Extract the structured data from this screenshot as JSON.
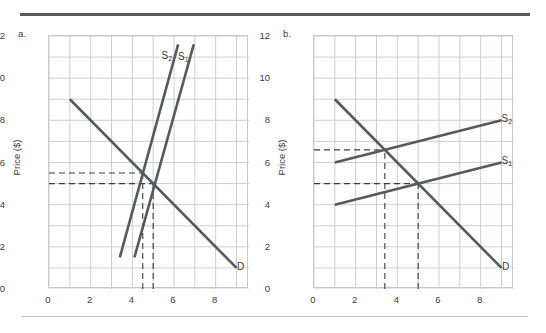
{
  "figure": {
    "background": "#ffffff",
    "rule_color": "#555a5e",
    "curve_color": "#555a5e",
    "grid_color": "#ccd0d2",
    "dash_color": "#3a3d40"
  },
  "chart_data": [
    {
      "type": "line",
      "panel": "a",
      "panel_label": "a.",
      "title": "",
      "xlabel": "",
      "ylabel": "Price ($)",
      "xlim": [
        0,
        9.6
      ],
      "ylim": [
        0,
        12
      ],
      "xticks": [
        0,
        2,
        4,
        6,
        8
      ],
      "yticks": [
        0,
        2,
        4,
        6,
        8,
        10,
        12
      ],
      "grid": true,
      "grid_step_x": 1,
      "grid_step_y": 1,
      "legend": "inline-labels",
      "series": [
        {
          "name": "D",
          "label": "D",
          "points": [
            [
              1,
              9
            ],
            [
              9,
              1
            ]
          ],
          "label_at": [
            9.25,
            1.05
          ]
        },
        {
          "name": "S1",
          "label": "S₁",
          "points": [
            [
              4.1,
              1.5
            ],
            [
              6.95,
              11.6
            ]
          ],
          "label_at": [
            6.5,
            11.0
          ]
        },
        {
          "name": "S2",
          "label": "S₂",
          "points": [
            [
              3.4,
              1.5
            ],
            [
              6.2,
              11.6
            ]
          ],
          "label_at": [
            5.7,
            11.05
          ]
        }
      ],
      "annotations": [
        {
          "type": "hline-dashed",
          "y": 5.5,
          "x_from": 0,
          "x_to": 4.5
        },
        {
          "type": "hline-dashed",
          "y": 5.0,
          "x_from": 0,
          "x_to": 5.0
        },
        {
          "type": "vline-dashed",
          "x": 4.5,
          "y_from": 0,
          "y_to": 5.5
        },
        {
          "type": "vline-dashed",
          "x": 5.0,
          "y_from": 0,
          "y_to": 5.0
        }
      ],
      "equilibria": [
        {
          "label": "S1 x D",
          "price": 5.0,
          "quantity": 5.0
        },
        {
          "label": "S2 x D",
          "price": 5.5,
          "quantity": 4.5
        }
      ]
    },
    {
      "type": "line",
      "panel": "b",
      "panel_label": "b.",
      "title": "",
      "xlabel": "",
      "ylabel": "Price ($)",
      "xlim": [
        0,
        9.6
      ],
      "ylim": [
        0,
        12
      ],
      "xticks": [
        0,
        2,
        4,
        6,
        8
      ],
      "yticks": [
        0,
        2,
        4,
        6,
        8,
        10,
        12
      ],
      "grid": true,
      "grid_step_x": 1,
      "grid_step_y": 1,
      "legend": "inline-labels",
      "series": [
        {
          "name": "D",
          "label": "D",
          "points": [
            [
              1,
              9
            ],
            [
              9,
              1
            ]
          ],
          "label_at": [
            9.25,
            1.05
          ]
        },
        {
          "name": "S1",
          "label": "S₁",
          "points": [
            [
              1,
              4
            ],
            [
              9,
              6
            ]
          ],
          "label_at": [
            9.3,
            6.05
          ]
        },
        {
          "name": "S2",
          "label": "S₂",
          "points": [
            [
              1,
              6
            ],
            [
              9,
              8
            ]
          ],
          "label_at": [
            9.3,
            8.05
          ]
        }
      ],
      "annotations": [
        {
          "type": "hline-dashed",
          "y": 6.6,
          "x_from": 0,
          "x_to": 3.4
        },
        {
          "type": "hline-dashed",
          "y": 5.0,
          "x_from": 0,
          "x_to": 5.0
        },
        {
          "type": "vline-dashed",
          "x": 3.4,
          "y_from": 0,
          "y_to": 6.6
        },
        {
          "type": "vline-dashed",
          "x": 5.0,
          "y_from": 0,
          "y_to": 5.0
        }
      ],
      "equilibria": [
        {
          "label": "S1 x D",
          "price": 5.0,
          "quantity": 5.0
        },
        {
          "label": "S2 x D",
          "price": 6.6,
          "quantity": 3.4
        }
      ]
    }
  ]
}
